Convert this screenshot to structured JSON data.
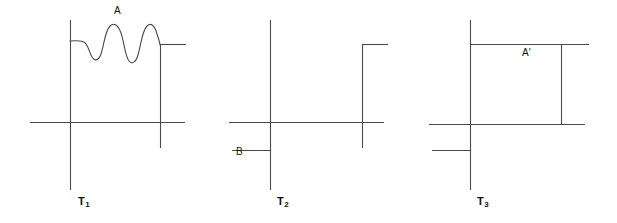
{
  "figure": {
    "type": "line-diagram",
    "background_color": "#ffffff",
    "line_color": "#4a4a4a",
    "text_color": "#111111",
    "width": 617,
    "height": 223
  },
  "panels": [
    {
      "id": "panel-t1",
      "label": "T",
      "label_subscript": "1",
      "label_full": "T1",
      "feature_label": "A",
      "feature_description": "oscillating wave across the top between the two vertical lines",
      "label_x": 78,
      "label_y": 196,
      "feature_label_x": 114,
      "feature_label_y": 6
    },
    {
      "id": "panel-t2",
      "label": "T",
      "label_subscript": "2",
      "label_full": "T2",
      "feature_label": "B",
      "feature_description": "short horizontal segment below the main horizontal line on the left",
      "label_x": 277,
      "label_y": 196,
      "feature_label_x": 236,
      "feature_label_y": 147
    },
    {
      "id": "panel-t3",
      "label": "T",
      "label_subscript": "3",
      "label_full": "T3",
      "feature_label": "A'",
      "feature_description": "flattened horizontal line across the top between the vertical lines",
      "label_x": 477,
      "label_y": 196,
      "feature_label_x": 522,
      "feature_label_y": 48
    }
  ],
  "geometry": {
    "panel_t1": {
      "left_vertical": {
        "x": 70,
        "y1": 20,
        "y2": 190
      },
      "right_vertical": {
        "x": 160,
        "y1": 44,
        "y2": 148
      },
      "main_horizontal": {
        "y": 122,
        "x1": 30,
        "x2": 185
      },
      "right_branch_horizontal": {
        "y": 44,
        "x1": 160,
        "x2": 186
      },
      "wave_baseline_left": {
        "y": 41,
        "x1": 70,
        "x2": 82
      },
      "wave_peaks": 3,
      "wave_troughs": 2
    },
    "panel_t2": {
      "left_vertical": {
        "x": 270,
        "y1": 20,
        "y2": 190
      },
      "right_vertical": {
        "x": 362,
        "y1": 44,
        "y2": 148
      },
      "main_horizontal": {
        "y": 122,
        "x1": 229,
        "x2": 384
      },
      "right_branch_horizontal": {
        "y": 44,
        "x1": 362,
        "x2": 388
      },
      "b_segment_horizontal": {
        "y": 150,
        "x1": 232,
        "x2": 270
      }
    },
    "panel_t3": {
      "left_vertical": {
        "x": 470,
        "y1": 20,
        "y2": 190
      },
      "inner_vertical": {
        "x": 561,
        "y1": 44,
        "y2": 124
      },
      "main_horizontal": {
        "y": 124,
        "x1": 429,
        "x2": 585
      },
      "top_horizontal": {
        "y": 44,
        "x1": 470,
        "x2": 589
      },
      "lower_left_segment": {
        "y": 150,
        "x1": 432,
        "x2": 470
      }
    }
  }
}
